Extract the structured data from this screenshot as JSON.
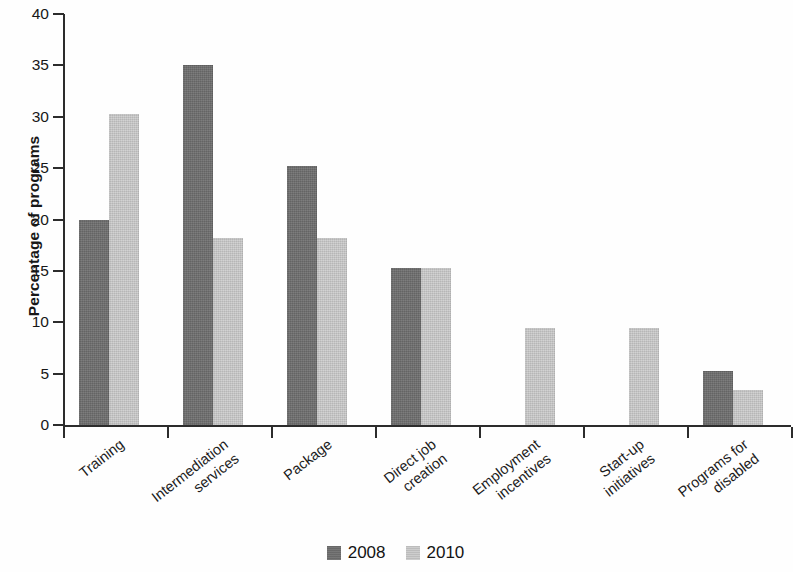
{
  "chart_data": {
    "type": "bar",
    "title": "",
    "subtitle": "",
    "xlabel": "",
    "ylabel": "Percentage of programs",
    "ylim": [
      0,
      40
    ],
    "yticks": [
      0,
      5,
      10,
      15,
      20,
      25,
      30,
      35,
      40
    ],
    "grid": false,
    "legend_position": "bottom-center",
    "categories": [
      "Training",
      "Intermediation services",
      "Package",
      "Direct job creation",
      "Employment incentives",
      "Start-up initiatives",
      "Programs for disabled"
    ],
    "category_lines": [
      [
        "Training"
      ],
      [
        "Intermediation",
        "services"
      ],
      [
        "Package"
      ],
      [
        "Direct job",
        "creation"
      ],
      [
        "Employment",
        "incentives"
      ],
      [
        "Start-up",
        "initiatives"
      ],
      [
        "Programs for",
        "disabled"
      ]
    ],
    "series": [
      {
        "name": "2008",
        "color": "#6e6e6e",
        "values": [
          20.0,
          35.0,
          25.2,
          15.3,
          0,
          0,
          5.3
        ]
      },
      {
        "name": "2010",
        "color": "#c6c6c6",
        "values": [
          30.3,
          18.2,
          18.2,
          15.3,
          9.4,
          9.4,
          3.4
        ]
      }
    ]
  },
  "axis": {
    "y_title": "Percentage of programs",
    "y_tick_labels": [
      "40",
      "35",
      "30",
      "25",
      "20",
      "15",
      "10",
      "5",
      "0"
    ]
  },
  "legend": {
    "items": [
      {
        "label": "2008",
        "color": "#6e6e6e"
      },
      {
        "label": "2010",
        "color": "#c6c6c6"
      }
    ]
  }
}
